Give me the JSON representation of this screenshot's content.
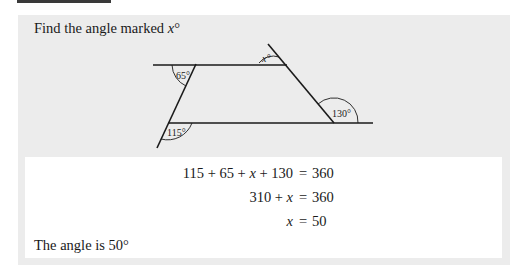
{
  "problem": {
    "prompt_text": "Find the angle marked ",
    "prompt_var": "x",
    "prompt_suffix": "°"
  },
  "figure": {
    "angle_labels": {
      "top_left": "65°",
      "apex": "x°",
      "bottom_right": "130°",
      "bottom_left": "115°"
    },
    "line_color": "#1a1a1a"
  },
  "solution": {
    "equations": [
      {
        "lhs_parts": [
          "115 + 65 + ",
          "x",
          " + 130"
        ],
        "eq": "=",
        "rhs": "360"
      },
      {
        "lhs_parts": [
          "310 + ",
          "x",
          ""
        ],
        "eq": "=",
        "rhs": "360"
      },
      {
        "lhs_parts": [
          "",
          "x",
          ""
        ],
        "eq": "=",
        "rhs": "50"
      }
    ],
    "conclusion": "The angle is 50°"
  },
  "colors": {
    "panel_bg": "#ececec",
    "solution_bg": "#ffffff",
    "top_bar": "#3a3a3a"
  }
}
